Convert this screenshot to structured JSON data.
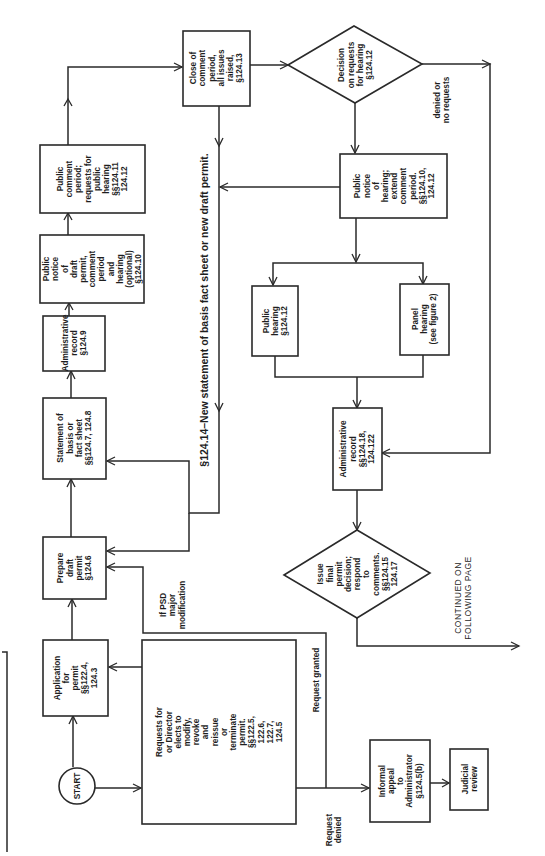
{
  "diagram": {
    "type": "flowchart",
    "orientation": "rotated-90-ccw",
    "nodes": {
      "start": {
        "shape": "circle",
        "lines": [
          "START"
        ]
      },
      "application": {
        "shape": "rect",
        "lines": [
          "Application",
          "for",
          "permit",
          "§§122.4,",
          "124.3"
        ]
      },
      "requests": {
        "shape": "rect",
        "lines": [
          "Requests for",
          "or Director",
          "elects to",
          "modify,",
          "revoke",
          "and",
          "reissue",
          "or",
          "terminate",
          "permit.",
          "§§122.5,",
          "122.6,",
          "122.7,",
          "124.5"
        ]
      },
      "prepare_draft": {
        "shape": "rect",
        "lines": [
          "Prepare",
          "draft",
          "permit",
          "§124.6"
        ]
      },
      "statement_basis": {
        "shape": "rect",
        "lines": [
          "Statement of",
          "basis or",
          "fact sheet",
          "§§124.7, 124.8"
        ]
      },
      "admin_record_1": {
        "shape": "rect",
        "lines": [
          "Administrative",
          "record",
          "§124.9"
        ]
      },
      "public_notice_draft": {
        "shape": "rect",
        "lines": [
          "Public",
          "notice",
          "of",
          "draft",
          "permit,",
          "comment",
          "period",
          "and",
          "hearing",
          "(optional)",
          "§124.10"
        ]
      },
      "public_comment": {
        "shape": "rect",
        "lines": [
          "Public",
          "comment",
          "period;",
          "requests for",
          "public",
          "hearing",
          "§§124.11",
          "124.12"
        ]
      },
      "close_comment": {
        "shape": "rect",
        "lines": [
          "Close of",
          "comment",
          "period,",
          "all issues",
          "raised,",
          "§124.13"
        ]
      },
      "decision": {
        "shape": "diamond",
        "lines": [
          "Decision",
          "on requests",
          "for hearing",
          "§124.12"
        ]
      },
      "public_notice_hearing": {
        "shape": "rect",
        "lines": [
          "Public",
          "notice",
          "of",
          "hearing;",
          "extend",
          "comment",
          "period.",
          "§§124.10,",
          "124.12"
        ]
      },
      "public_hearing": {
        "shape": "rect",
        "lines": [
          "Public",
          "hearing",
          "§124.12"
        ]
      },
      "panel_hearing": {
        "shape": "rect",
        "lines": [
          "Panel",
          "hearing",
          "(see figure 2)"
        ]
      },
      "admin_record_2": {
        "shape": "rect",
        "lines": [
          "Administrative",
          "record",
          "§§124.18,",
          "124.122"
        ]
      },
      "final_decision": {
        "shape": "diamond",
        "lines": [
          "Issue",
          "final",
          "permit",
          "decision;",
          "respond",
          "to",
          "comments.",
          "§§124.15",
          "124.17"
        ]
      },
      "informal_appeal": {
        "shape": "rect",
        "lines": [
          "Informal",
          "appeal",
          "to",
          "Administrator",
          "§124.5(b)"
        ]
      },
      "judicial_review": {
        "shape": "rect",
        "lines": [
          "Judicial",
          "review"
        ]
      }
    },
    "edge_labels": {
      "psd": [
        "If PSD",
        "major",
        "modification"
      ],
      "request_granted": [
        "Request granted"
      ],
      "request_denied": [
        "Request",
        "denied"
      ],
      "denied_no_requests": [
        "denied or",
        "no requests"
      ],
      "new_statement": [
        "§124.14–New statement of basis  fact sheet or new draft permit."
      ],
      "continued": [
        "CONTINUED ON",
        "FOLLOWING PAGE"
      ]
    },
    "edges": [
      {
        "from": "start",
        "to": "application"
      },
      {
        "from": "start",
        "to": "requests"
      },
      {
        "from": "requests",
        "to": "application",
        "label": "psd"
      },
      {
        "from": "requests",
        "to": "prepare_draft",
        "label": "request_granted"
      },
      {
        "from": "requests",
        "to": "informal_appeal",
        "label": "request_denied"
      },
      {
        "from": "informal_appeal",
        "to": "judicial_review"
      },
      {
        "from": "application",
        "to": "prepare_draft"
      },
      {
        "from": "prepare_draft",
        "to": "statement_basis"
      },
      {
        "from": "statement_basis",
        "to": "admin_record_1"
      },
      {
        "from": "admin_record_1",
        "to": "public_notice_draft"
      },
      {
        "from": "public_notice_draft",
        "to": "public_comment"
      },
      {
        "from": "public_comment",
        "to": "close_comment"
      },
      {
        "from": "close_comment",
        "to": "decision"
      },
      {
        "from": "close_comment",
        "to": "prepare_draft",
        "label": "new_statement"
      },
      {
        "from": "close_comment",
        "to": "statement_basis",
        "label": "new_statement"
      },
      {
        "from": "public_notice_hearing",
        "to": "prepare_draft",
        "label": "new_statement"
      },
      {
        "from": "decision",
        "to": "public_notice_hearing"
      },
      {
        "from": "decision",
        "to": "admin_record_2",
        "label": "denied_no_requests"
      },
      {
        "from": "public_notice_hearing",
        "to": "public_hearing"
      },
      {
        "from": "public_notice_hearing",
        "to": "panel_hearing"
      },
      {
        "from": "public_hearing",
        "to": "admin_record_2"
      },
      {
        "from": "panel_hearing",
        "to": "admin_record_2"
      },
      {
        "from": "admin_record_2",
        "to": "final_decision"
      },
      {
        "from": "final_decision",
        "to": "continued_page",
        "label": "continued"
      }
    ]
  }
}
